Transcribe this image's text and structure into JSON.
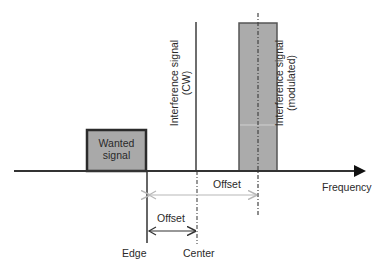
{
  "diagram": {
    "axis": {
      "label": "Frequency"
    },
    "wanted_signal": {
      "label_line1": "Wanted",
      "label_line2": "signal",
      "fill": "#a9a9a9",
      "stroke": "#2b2b2b"
    },
    "interference_cw": {
      "label_line1": "Interference signal",
      "label_line2": "(CW)",
      "stroke": "#6e6e6e"
    },
    "interference_modulated": {
      "label_line1": "Interference signal",
      "label_line2": "(modulated)",
      "fill": "#ababab",
      "stroke": "#555555"
    },
    "offset_upper": {
      "label": "Offset",
      "color": "#b8b8b8"
    },
    "offset_lower": {
      "label": "Offset",
      "color": "#333333"
    },
    "markers": {
      "edge": "Edge",
      "center": "Center"
    }
  }
}
